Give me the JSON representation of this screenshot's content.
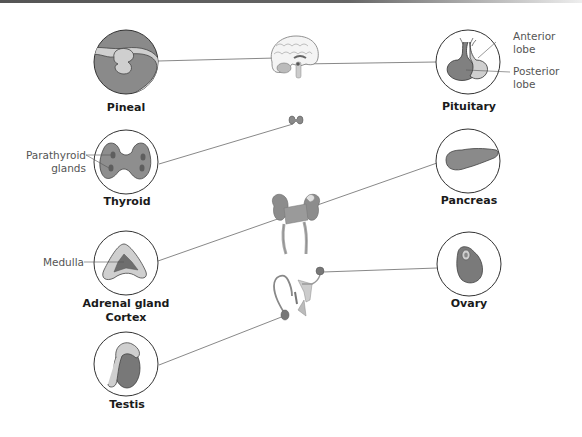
{
  "diagram": {
    "colors": {
      "outline": "#333333",
      "dark_fill": "#7a7a7a",
      "mid_fill": "#9a9a9a",
      "light_fill": "#cfcfcf",
      "leader_line": "#666666"
    },
    "glands": [
      {
        "id": "pineal",
        "label": "Pineal",
        "side": "left"
      },
      {
        "id": "pituitary",
        "label": "Pituitary",
        "side": "right",
        "callouts": [
          "Anterior\nlobe",
          "Posterior\nlobe"
        ]
      },
      {
        "id": "thyroid",
        "label": "Thyroid",
        "side": "left",
        "callouts": [
          "Parathyroid\nglands"
        ]
      },
      {
        "id": "pancreas",
        "label": "Pancreas",
        "side": "right"
      },
      {
        "id": "adrenal",
        "label": "Adrenal gland",
        "sublabel": "Cortex",
        "side": "left",
        "callouts": [
          "Medulla"
        ]
      },
      {
        "id": "ovary",
        "label": "Ovary",
        "side": "right"
      },
      {
        "id": "testis",
        "label": "Testis",
        "side": "left"
      }
    ],
    "callouts": {
      "anterior_1": "Anterior",
      "anterior_2": "lobe",
      "posterior_1": "Posterior",
      "posterior_2": "lobe",
      "parathyroid_1": "Parathyroid",
      "parathyroid_2": "glands",
      "medulla": "Medulla"
    },
    "labels": {
      "pineal": "Pineal",
      "pituitary": "Pituitary",
      "thyroid": "Thyroid",
      "pancreas": "Pancreas",
      "adrenal": "Adrenal gland",
      "adrenal_sub": "Cortex",
      "ovary": "Ovary",
      "testis": "Testis"
    }
  }
}
